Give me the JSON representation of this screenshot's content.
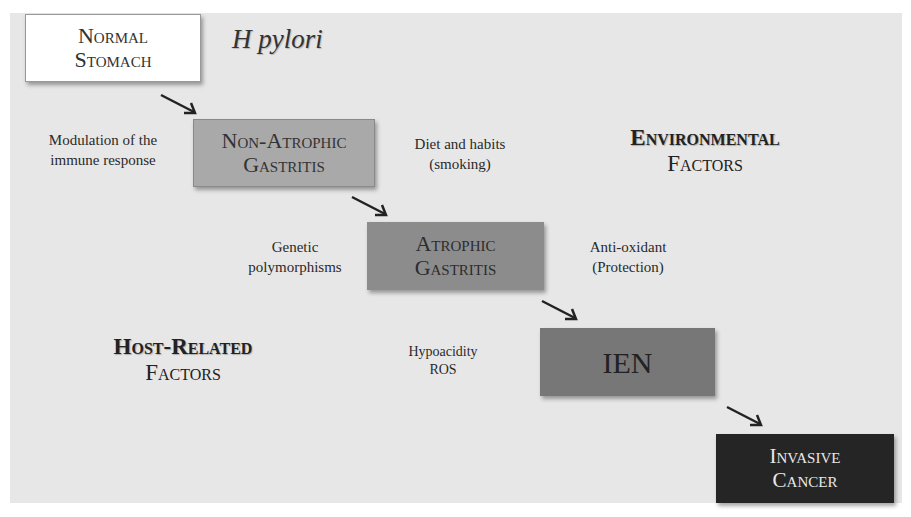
{
  "diagram": {
    "title_agent": "H pylori",
    "stages": [
      {
        "line1": "Normal",
        "line2": "Stomach",
        "fill": "#ffffff"
      },
      {
        "line1": "Non-Atrophic",
        "line2": "Gastritis",
        "fill": "#a9a9a9"
      },
      {
        "line1": "Atrophic",
        "line2": "Gastritis",
        "fill": "#8c8c8c"
      },
      {
        "line1": "IEN",
        "fill": "#777777"
      },
      {
        "line1": "Invasive",
        "line2": "Cancer",
        "fill": "#252525"
      }
    ],
    "annotations": {
      "immune": {
        "line1": "Modulation of the",
        "line2": "immune response"
      },
      "diet": {
        "line1": "Diet and habits",
        "line2": "(smoking)"
      },
      "genetic": {
        "line1": "Genetic",
        "line2": "polymorphisms"
      },
      "antioxidant": {
        "line1": "Anti-oxidant",
        "line2": "(Protection)"
      },
      "hypoacidity": {
        "line1": "Hypoacidity",
        "line2": "ROS"
      }
    },
    "factor_groups": {
      "environmental": {
        "line1": "Environmental",
        "line2": "Factors"
      },
      "host": {
        "line1": "Host-Related",
        "line2": "Factors"
      }
    },
    "edges": [
      {
        "from": "Normal Stomach",
        "to": "Non-Atrophic Gastritis"
      },
      {
        "from": "Non-Atrophic Gastritis",
        "to": "Atrophic Gastritis"
      },
      {
        "from": "Atrophic Gastritis",
        "to": "IEN"
      },
      {
        "from": "IEN",
        "to": "Invasive Cancer"
      }
    ]
  }
}
